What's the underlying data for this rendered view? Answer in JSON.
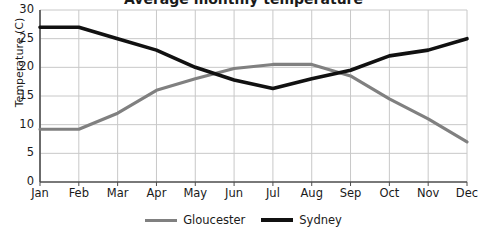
{
  "chart_data": {
    "type": "line",
    "title": "Average monthly temperature",
    "title_clipped": true,
    "xlabel": "",
    "ylabel": "Temperature (C)",
    "categories": [
      "Jan",
      "Feb",
      "Mar",
      "Apr",
      "May",
      "Jun",
      "Jul",
      "Aug",
      "Sep",
      "Oct",
      "Nov",
      "Dec"
    ],
    "ylim": [
      0,
      30
    ],
    "yticks": [
      0,
      5,
      10,
      15,
      20,
      25,
      30
    ],
    "grid": true,
    "legend_position": "bottom",
    "series": [
      {
        "name": "Gloucester",
        "color": "#808080",
        "values": [
          9.2,
          9.2,
          12.0,
          16.0,
          18.0,
          19.8,
          20.5,
          20.5,
          18.5,
          14.5,
          11.0,
          7.0
        ]
      },
      {
        "name": "Sydney",
        "color": "#111111",
        "values": [
          27.0,
          27.0,
          25.0,
          23.0,
          20.0,
          17.8,
          16.3,
          18.0,
          19.5,
          22.0,
          23.0,
          25.0
        ]
      }
    ]
  },
  "axis": {
    "y_title": "Temperature (C)",
    "y_tick_labels": [
      "30",
      "25",
      "20",
      "15",
      "10",
      "5",
      "0"
    ],
    "x_tick_labels": [
      "Jan",
      "Feb",
      "Mar",
      "Apr",
      "May",
      "Jun",
      "Jul",
      "Aug",
      "Sep",
      "Oct",
      "Nov",
      "Dec"
    ]
  },
  "legend": {
    "entries": [
      {
        "label": "Gloucester",
        "color": "#808080"
      },
      {
        "label": "Sydney",
        "color": "#111111"
      }
    ]
  },
  "colors": {
    "gloucester": "#808080",
    "sydney": "#111111",
    "gridline": "#c8c8c8",
    "axis": "#4d4d4d",
    "background": "#ffffff"
  }
}
